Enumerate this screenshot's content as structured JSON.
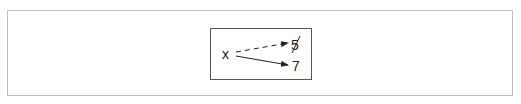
{
  "diagram": {
    "type": "state-diagram",
    "variable": {
      "name": "x"
    },
    "values": [
      {
        "label": "5",
        "status": "old",
        "crossed_out": true,
        "arrow_style": "dashed"
      },
      {
        "label": "7",
        "status": "current",
        "crossed_out": false,
        "arrow_style": "solid"
      }
    ],
    "colors": {
      "outer_border": "#bdbdbd",
      "inner_border": "#555555",
      "ink": "#222222",
      "background": "#ffffff"
    }
  }
}
